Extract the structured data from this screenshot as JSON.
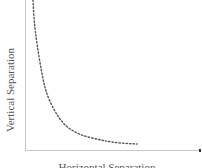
{
  "chart_data": {
    "type": "line",
    "title": "",
    "xlabel": "Horizontal Separation",
    "ylabel": "Vertical Separation",
    "grid": false,
    "legend": null,
    "ticks": "none",
    "series": [
      {
        "name": "trade-off curve",
        "style": "dotted",
        "color": "#555555",
        "points_px": [
          [
            33,
            0
          ],
          [
            34,
            20
          ],
          [
            37,
            45
          ],
          [
            43,
            80
          ],
          [
            47,
            95
          ],
          [
            55,
            112
          ],
          [
            65,
            126
          ],
          [
            80,
            135
          ],
          [
            100,
            140
          ],
          [
            118,
            143
          ],
          [
            137,
            144
          ]
        ]
      }
    ],
    "axes": {
      "origin_px": [
        25,
        150
      ],
      "x_end_px": 200,
      "color": "#c8c8c8"
    }
  },
  "labels": {
    "y": "Vertical Separation",
    "x": "Horizontal Separation"
  }
}
